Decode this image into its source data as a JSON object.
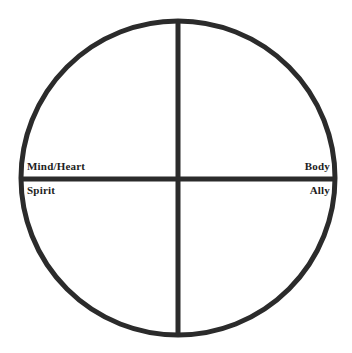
{
  "diagram": {
    "type": "quadrant-circle",
    "title": "",
    "background_color": "#ffffff",
    "stroke_color": "#2b2b2b",
    "text_color": "#1d1d1d",
    "circle": {
      "center_x": 178,
      "center_y": 178,
      "radius": 157,
      "stroke_width": 5
    },
    "axes": {
      "vertical_stroke_width": 5,
      "horizontal_stroke_width": 5
    },
    "quadrant_labels": [
      {
        "id": "mind-heart",
        "text": "Mind/Heart",
        "quadrant": "upper-left",
        "align": "left"
      },
      {
        "id": "body",
        "text": "Body",
        "quadrant": "upper-right",
        "align": "right"
      },
      {
        "id": "spirit",
        "text": "Spirit",
        "quadrant": "lower-left",
        "align": "left"
      },
      {
        "id": "ally",
        "text": "Ally",
        "quadrant": "lower-right",
        "align": "right"
      }
    ]
  }
}
